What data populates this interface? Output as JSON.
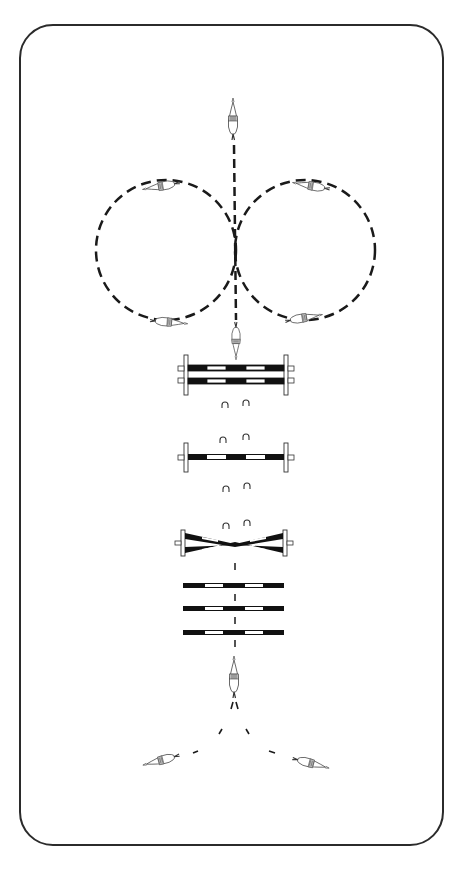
{
  "diagram": {
    "arena": {
      "shape": "rounded-rectangle",
      "border_color": "#2b2b2b"
    },
    "elements": [
      {
        "type": "horse-rider",
        "label": "Start - approaching on center line",
        "position": "top-center"
      },
      {
        "type": "track",
        "label": "Left circle",
        "style": "dashed",
        "direction": "counterclockwise"
      },
      {
        "type": "track",
        "label": "Right circle",
        "style": "dashed",
        "direction": "clockwise"
      },
      {
        "type": "horse-rider",
        "label": "Rider on left circle top"
      },
      {
        "type": "horse-rider",
        "label": "Rider on left circle bottom"
      },
      {
        "type": "horse-rider",
        "label": "Rider on right circle top"
      },
      {
        "type": "horse-rider",
        "label": "Rider on right circle bottom"
      },
      {
        "type": "horse-rider",
        "label": "Rider on center line heading to jumps"
      },
      {
        "type": "jump",
        "label": "Vertical with two rails (standards)"
      },
      {
        "type": "hoofprints",
        "label": "Stride marks"
      },
      {
        "type": "jump",
        "label": "Single-rail vertical (standards)"
      },
      {
        "type": "hoofprints",
        "label": "Stride marks"
      },
      {
        "type": "jump",
        "label": "Crossrail (standards)"
      },
      {
        "type": "ground-pole",
        "label": "Ground pole 1"
      },
      {
        "type": "ground-pole",
        "label": "Ground pole 2"
      },
      {
        "type": "ground-pole",
        "label": "Ground pole 3"
      },
      {
        "type": "horse-rider",
        "label": "Rider after poles, center line"
      },
      {
        "type": "track",
        "label": "Split: turn left or right",
        "style": "dashed"
      },
      {
        "type": "horse-rider",
        "label": "Rider turning left (bottom-left)"
      },
      {
        "type": "horse-rider",
        "label": "Rider turning right (bottom-right)"
      }
    ],
    "colors": {
      "ink": "#1a1a1a",
      "pole_dark": "#111111",
      "pole_light": "#ffffff",
      "background": "#ffffff"
    }
  }
}
